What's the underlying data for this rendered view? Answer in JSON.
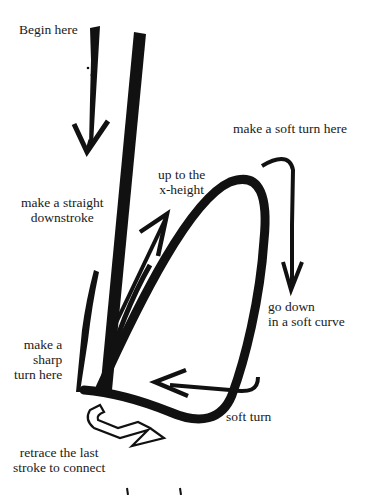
{
  "diagram": {
    "colors": {
      "ink": "#111111",
      "paper": "#ffffff"
    },
    "labels": {
      "begin": "Begin here",
      "straight_downstroke": "make a straight\ndownstroke",
      "soft_turn_top": "make a soft turn here",
      "up_to_x_height": "up to the\nx-height",
      "go_down": "go down\nin a soft curve",
      "sharp_turn": "make a\nsharp\nturn here",
      "soft_turn_bottom": "soft turn",
      "retrace": "retrace the last\nstroke to connect"
    },
    "arrows": [
      {
        "name": "down-arrow",
        "direction": "down"
      },
      {
        "name": "up-arrow",
        "direction": "up-right"
      },
      {
        "name": "soft-turn-arrow",
        "direction": "down"
      },
      {
        "name": "left-arrow",
        "direction": "left"
      },
      {
        "name": "retrace-arrow",
        "direction": "right",
        "style": "outline"
      }
    ]
  }
}
